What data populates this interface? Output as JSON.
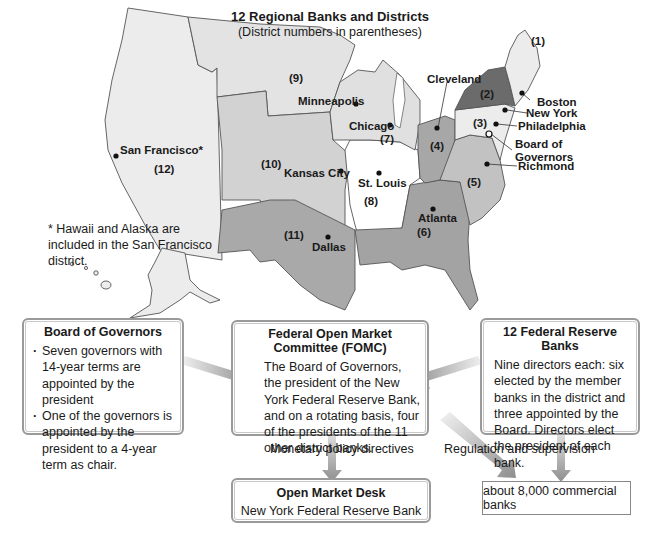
{
  "map": {
    "title": "12 Regional Banks and Districts",
    "subtitle": "(District numbers in parentheses)",
    "footnote": "* Hawaii and Alaska are included in the San Francisco district.",
    "districts": [
      {
        "number": "(1)",
        "bank": "Boston"
      },
      {
        "number": "(2)",
        "bank": "New York"
      },
      {
        "number": "(3)",
        "bank": "Philadelphia"
      },
      {
        "number": "(4)",
        "bank": "Cleveland"
      },
      {
        "number": "(5)",
        "bank": "Richmond"
      },
      {
        "number": "(6)",
        "bank": "Atlanta"
      },
      {
        "number": "(7)",
        "bank": "Chicago"
      },
      {
        "number": "(8)",
        "bank": "St. Louis"
      },
      {
        "number": "(9)",
        "bank": "Minneapolis"
      },
      {
        "number": "(10)",
        "bank": "Kansas City"
      },
      {
        "number": "(11)",
        "bank": "Dallas"
      },
      {
        "number": "(12)",
        "bank": "San Francisco*"
      }
    ],
    "board_label": "Board of Governors",
    "colors": {
      "light": "#ececec",
      "medium_light": "#d6d6d6",
      "medium": "#bdbdbd",
      "medium_dark": "#a8a8a8",
      "dark": "#6b6b6b",
      "white": "#ffffff"
    }
  },
  "boxes": {
    "board": {
      "title": "Board of Governors",
      "bullets": [
        "Seven governors with 14-year terms are appointed by the president",
        "One of the governors is appointed by the president to a 4-year term as chair."
      ]
    },
    "fomc": {
      "title": "Federal Open Market Committee (FOMC)",
      "text": "The Board of Governors, the president of the New York Federal Reserve Bank, and on a rotating basis, four of the presidents of the 11 other district banks."
    },
    "reserve_banks": {
      "title": "12 Federal Reserve Banks",
      "text": "Nine directors each: six elected by the member banks in the district and three appointed by the Board. Directors elect the president of each bank."
    },
    "desk": {
      "title": "Open Market Desk",
      "text": "New York Federal Reserve Bank"
    },
    "commercial": {
      "text": "about 8,000 commercial banks"
    }
  },
  "flows": {
    "monetary": "Monetary policy directives",
    "regulation": "Regulation and supervision"
  }
}
